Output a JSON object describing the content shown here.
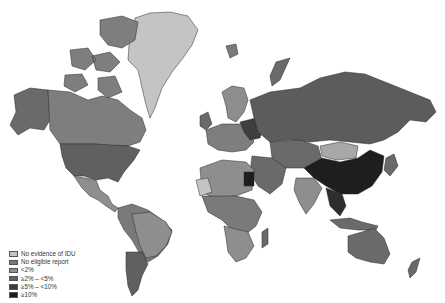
{
  "map": {
    "type": "choropleth",
    "subject": "Prevalence of injecting drug use (IDU)",
    "projection": "world",
    "colors": {
      "no_evidence": "#c4c4c4",
      "no_report": "#7a7a7a",
      "lt2": "#8e8e8e",
      "2to5": "#606060",
      "5to10": "#3e3e3e",
      "gte10": "#1e1e1e",
      "water": "#ffffff"
    }
  },
  "legend": {
    "items": [
      {
        "label": "No evidence of IDU",
        "color": "#c4c4c4"
      },
      {
        "label": "No eligible report",
        "color": "#7a7a7a"
      },
      {
        "label": "<2%",
        "color": "#8e8e8e"
      },
      {
        "label": "≥2% – <5%",
        "color": "#606060"
      },
      {
        "label": "≥5% – <10%",
        "color": "#3e3e3e"
      },
      {
        "label": "≥10%",
        "color": "#1e1e1e"
      }
    ]
  }
}
